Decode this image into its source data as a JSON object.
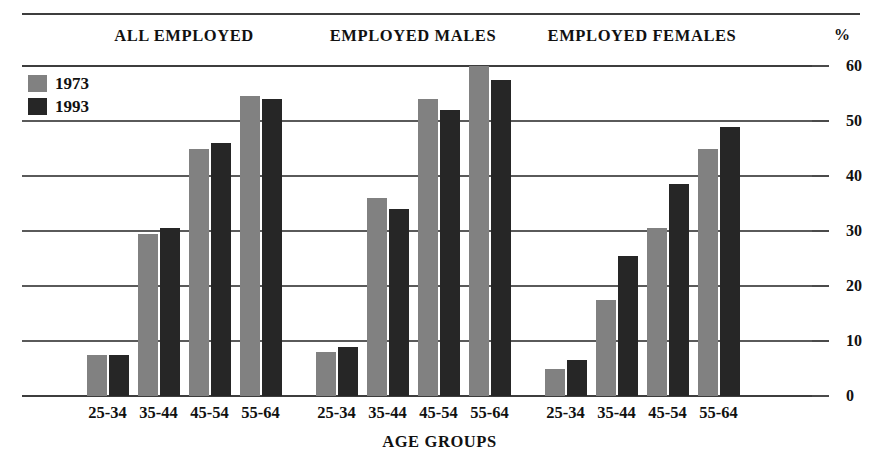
{
  "chart_data": {
    "type": "bar",
    "title": "",
    "subtitle": "",
    "xlabel": "AGE GROUPS",
    "ylabel": "%",
    "ylim": [
      0,
      60
    ],
    "yticks": [
      0,
      10,
      20,
      30,
      40,
      50,
      60
    ],
    "ytick_labels": [
      "0",
      "10",
      "20",
      "30",
      "40",
      "50",
      "60"
    ],
    "grid": true,
    "legend_position": "top-left",
    "categories": [
      "25-34",
      "35-44",
      "45-54",
      "55-64"
    ],
    "panels": [
      {
        "name": "ALL EMPLOYED",
        "categories": [
          "25-34",
          "35-44",
          "45-54",
          "55-64"
        ],
        "series": [
          {
            "name": "1973",
            "color": "#818181",
            "values": [
              7.5,
              29.5,
              45.0,
              54.5
            ]
          },
          {
            "name": "1993",
            "color": "#262626",
            "values": [
              7.5,
              30.5,
              46.0,
              54.0
            ]
          }
        ]
      },
      {
        "name": "EMPLOYED MALES",
        "categories": [
          "25-34",
          "35-44",
          "45-54",
          "55-64"
        ],
        "series": [
          {
            "name": "1973",
            "color": "#818181",
            "values": [
              8.0,
              36.0,
              54.0,
              60.0
            ]
          },
          {
            "name": "1993",
            "color": "#262626",
            "values": [
              9.0,
              34.0,
              52.0,
              57.5
            ]
          }
        ]
      },
      {
        "name": "EMPLOYED FEMALES",
        "categories": [
          "25-34",
          "35-44",
          "45-54",
          "55-64"
        ],
        "series": [
          {
            "name": "1973",
            "color": "#818181",
            "values": [
              5.0,
              17.5,
              30.5,
              45.0
            ]
          },
          {
            "name": "1993",
            "color": "#262626",
            "values": [
              6.5,
              25.5,
              38.5,
              49.0
            ]
          }
        ]
      }
    ],
    "legend": [
      {
        "label": "1973",
        "color": "#818181"
      },
      {
        "label": "1993",
        "color": "#262626"
      }
    ]
  },
  "legend": {
    "items": [
      {
        "label": "1973"
      },
      {
        "label": "1993"
      }
    ]
  },
  "axis": {
    "percent_symbol": "%",
    "x_title": "AGE GROUPS"
  }
}
